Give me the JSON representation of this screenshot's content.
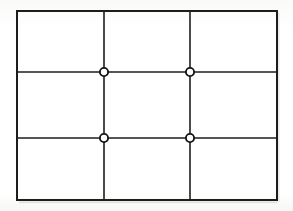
{
  "figure": {
    "kind": "grid-diagram",
    "caption": "",
    "background_color": "#fdfdfc",
    "line_color": "#1d1d1d",
    "marker_fill_color": "#ffffff",
    "marker_stroke_color": "#151515",
    "outer_border": {
      "x": 17,
      "y": 11,
      "width": 260,
      "height": 189,
      "stroke_width": 2.0
    },
    "grid": {
      "columns": 3,
      "rows": 3,
      "vertical_lines_x": [
        104,
        190
      ],
      "horizontal_lines_y": [
        72,
        138
      ],
      "interior_stroke_width": 1.6
    },
    "markers": [
      {
        "label": "node-1",
        "x": 104,
        "y": 72,
        "radius": 4.1,
        "stroke_width": 1.9
      },
      {
        "label": "node-2",
        "x": 190,
        "y": 72,
        "radius": 4.1,
        "stroke_width": 1.9
      },
      {
        "label": "node-3",
        "x": 104,
        "y": 138,
        "radius": 4.1,
        "stroke_width": 1.9
      },
      {
        "label": "node-4",
        "x": 190,
        "y": 138,
        "radius": 4.1,
        "stroke_width": 1.9
      }
    ],
    "cells": [
      {
        "label": "cell-r1c1",
        "x": 17,
        "y": 11,
        "width": 87,
        "height": 61
      },
      {
        "label": "cell-r1c2",
        "x": 104,
        "y": 11,
        "width": 86,
        "height": 61
      },
      {
        "label": "cell-r1c3",
        "x": 190,
        "y": 11,
        "width": 87,
        "height": 61
      },
      {
        "label": "cell-r2c1",
        "x": 17,
        "y": 72,
        "width": 87,
        "height": 66
      },
      {
        "label": "cell-r2c2",
        "x": 104,
        "y": 72,
        "width": 86,
        "height": 66
      },
      {
        "label": "cell-r2c3",
        "x": 190,
        "y": 72,
        "width": 87,
        "height": 66
      },
      {
        "label": "cell-r3c1",
        "x": 17,
        "y": 138,
        "width": 87,
        "height": 62
      },
      {
        "label": "cell-r3c2",
        "x": 104,
        "y": 138,
        "width": 86,
        "height": 62
      },
      {
        "label": "cell-r3c3",
        "x": 190,
        "y": 138,
        "width": 87,
        "height": 62
      }
    ]
  }
}
